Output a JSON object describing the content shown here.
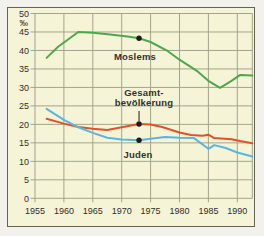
{
  "chart": {
    "annotation_labels": {
      "moslems": "Moslems",
      "gesamtbevoelkerung": "Gesamt-\nbevölkerung",
      "juden": "Juden"
    }
  },
  "chart_data": {
    "type": "line",
    "title": "",
    "xlabel": "",
    "ylabel": "‰",
    "xlim": [
      1955,
      1992.6
    ],
    "ylim": [
      0,
      50
    ],
    "x_ticks": [
      1955,
      1960,
      1965,
      1970,
      1975,
      1980,
      1985,
      1990
    ],
    "y_ticks": [
      0,
      5,
      10,
      15,
      20,
      25,
      30,
      35,
      40,
      45,
      50
    ],
    "grid": true,
    "grid_color": "#a2a48d",
    "background_color": "#f6f4d7",
    "marker_color": "#1c1c1c",
    "series": [
      {
        "name": "Moslems",
        "color": "#4ca84c",
        "marker_point": {
          "x": 1973,
          "y": 43.3
        },
        "points": [
          [
            1957,
            38
          ],
          [
            1959,
            41
          ],
          [
            1962.5,
            45
          ],
          [
            1965,
            44.8
          ],
          [
            1968,
            44.3
          ],
          [
            1971,
            43.8
          ],
          [
            1973,
            43.3
          ],
          [
            1975,
            42.3
          ],
          [
            1978,
            39.8
          ],
          [
            1980,
            37.5
          ],
          [
            1983,
            34.5
          ],
          [
            1985,
            31.8
          ],
          [
            1987,
            29.9
          ],
          [
            1989,
            31.8
          ],
          [
            1990.5,
            33.4
          ],
          [
            1992.6,
            33.2
          ]
        ]
      },
      {
        "name": "Gesamtbevölkerung",
        "color": "#e1522b",
        "marker_point": {
          "x": 1973,
          "y": 20.1
        },
        "points": [
          [
            1957,
            21.5
          ],
          [
            1960,
            20.2
          ],
          [
            1962.5,
            19.3
          ],
          [
            1965,
            18.8
          ],
          [
            1967.5,
            18.5
          ],
          [
            1970,
            19.2
          ],
          [
            1973,
            20.1
          ],
          [
            1975,
            20.0
          ],
          [
            1977,
            19.3
          ],
          [
            1980,
            17.8
          ],
          [
            1982,
            17.1
          ],
          [
            1984,
            16.9
          ],
          [
            1985,
            17.2
          ],
          [
            1986,
            16.3
          ],
          [
            1989,
            16.0
          ],
          [
            1990.5,
            15.5
          ],
          [
            1992.6,
            14.9
          ]
        ]
      },
      {
        "name": "Juden",
        "color": "#57b6e3",
        "marker_point": {
          "x": 1973,
          "y": 15.7
        },
        "points": [
          [
            1957,
            24.2
          ],
          [
            1960,
            21.2
          ],
          [
            1962.5,
            19.2
          ],
          [
            1965,
            17.7
          ],
          [
            1967.5,
            16.4
          ],
          [
            1970,
            15.9
          ],
          [
            1973,
            15.7
          ],
          [
            1975,
            16.1
          ],
          [
            1977.5,
            16.6
          ],
          [
            1980,
            16.4
          ],
          [
            1982.5,
            16.3
          ],
          [
            1985,
            13.4
          ],
          [
            1986,
            14.4
          ],
          [
            1988,
            13.6
          ],
          [
            1990,
            12.4
          ],
          [
            1992.6,
            11.3
          ]
        ]
      }
    ]
  }
}
